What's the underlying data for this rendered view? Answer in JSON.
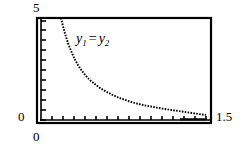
{
  "figure": {
    "name": "graphing-calculator-plot",
    "background_color": "#ffffff",
    "ink_color": "#000000"
  },
  "annotation": {
    "y_symbol": "y",
    "sub_one": "1",
    "equals": "=",
    "sub_two": "2",
    "full_text": "y1 = y2"
  },
  "axes": {
    "y_max_label": "5",
    "y_min_label": "0",
    "x_min_label": "0",
    "x_max_label": "1.5"
  },
  "chart_data": {
    "type": "line",
    "title": "",
    "subtitle": "",
    "xlabel": "",
    "ylabel": "",
    "xlim": [
      0,
      1.5
    ],
    "ylim": [
      0,
      5
    ],
    "grid": false,
    "legend_position": "inline-annotation",
    "xtick_labels": [
      "0",
      "1.5"
    ],
    "ytick_labels": [
      "0",
      "5"
    ],
    "xtick_values": [
      0,
      0.1,
      0.2,
      0.3,
      0.4,
      0.5,
      0.6,
      0.7,
      0.8,
      0.9,
      1.0,
      1.1,
      1.2,
      1.3,
      1.4,
      1.5
    ],
    "ytick_values": [
      0,
      0.5,
      1.0,
      1.5,
      2.0,
      2.5,
      3.0,
      3.5,
      4.0,
      4.5,
      5.0
    ],
    "annotations": [
      {
        "text": "y1 = y2",
        "x": 0.35,
        "y": 4.1
      }
    ],
    "series": [
      {
        "name": "y1 = y2",
        "style": "dotted",
        "color": "#000000",
        "x": [
          0.18,
          0.2,
          0.22,
          0.25,
          0.28,
          0.3,
          0.33,
          0.36,
          0.4,
          0.44,
          0.48,
          0.52,
          0.56,
          0.6,
          0.65,
          0.7,
          0.75,
          0.8,
          0.85,
          0.9,
          0.95,
          1.0,
          1.05,
          1.1,
          1.15,
          1.2,
          1.25,
          1.3,
          1.35,
          1.4,
          1.45,
          1.5
        ],
        "y": [
          5.0,
          4.6,
          4.2,
          3.7,
          3.3,
          3.05,
          2.75,
          2.5,
          2.22,
          1.98,
          1.8,
          1.63,
          1.49,
          1.37,
          1.23,
          1.11,
          1.01,
          0.92,
          0.84,
          0.77,
          0.71,
          0.66,
          0.61,
          0.56,
          0.52,
          0.48,
          0.44,
          0.4,
          0.36,
          0.32,
          0.28,
          0.24
        ]
      }
    ]
  }
}
